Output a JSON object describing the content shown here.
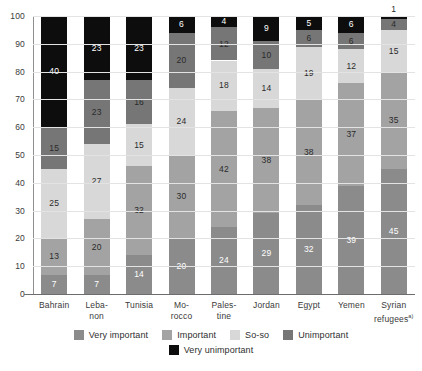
{
  "chart_data": {
    "type": "bar",
    "subtype": "stacked-bar-100-percent",
    "title": "",
    "subtitle": "",
    "xlabel": "",
    "ylabel": "",
    "ylim": [
      0,
      100
    ],
    "yticks": [
      0,
      10,
      20,
      30,
      40,
      50,
      60,
      70,
      80,
      90,
      100
    ],
    "grid": true,
    "grid_axis": "y",
    "legend_position": "bottom",
    "stack_order": "bottom-to-top",
    "categories": [
      "Bahrain",
      "Lebanon",
      "Tunisia",
      "Morocco",
      "Palestine",
      "Jordan",
      "Egypt",
      "Yemen",
      "Syrian refugees"
    ],
    "category_labels_wrapped": [
      [
        "Bahrain"
      ],
      [
        "Leba-",
        "non"
      ],
      [
        "Tunisia"
      ],
      [
        "Mo-",
        "rocco"
      ],
      [
        "Pales-",
        "tine"
      ],
      [
        "Jordan"
      ],
      [
        "Egypt"
      ],
      [
        "Yemen"
      ],
      [
        "Syrian",
        "refugees"
      ]
    ],
    "category_label_superscript": [
      "",
      "",
      "",
      "",
      "",
      "",
      "",
      "",
      "a)"
    ],
    "series": [
      {
        "name": "Very important",
        "color": "#8b8b8b",
        "label_color": "light",
        "values": [
          7,
          7,
          14,
          20,
          24,
          29,
          32,
          39,
          45
        ]
      },
      {
        "name": "Important",
        "color": "#a3a3a3",
        "label_color": "dark",
        "values": [
          13,
          20,
          32,
          30,
          42,
          38,
          38,
          37,
          35
        ]
      },
      {
        "name": "So-so",
        "color": "#d8d8d8",
        "label_color": "dark",
        "values": [
          25,
          27,
          15,
          24,
          18,
          14,
          19,
          12,
          15
        ]
      },
      {
        "name": "Unimportant",
        "color": "#767676",
        "label_color": "dark",
        "values": [
          15,
          23,
          16,
          20,
          12,
          10,
          6,
          6,
          4
        ]
      },
      {
        "name": "Very unimportant",
        "color": "#0d0d0d",
        "label_color": "light",
        "values": [
          40,
          23,
          23,
          6,
          4,
          9,
          5,
          6,
          1
        ]
      }
    ]
  },
  "legend": {
    "items": [
      {
        "label": "Very important",
        "color": "#8b8b8b"
      },
      {
        "label": "Important",
        "color": "#a3a3a3"
      },
      {
        "label": "So-so",
        "color": "#d8d8d8"
      },
      {
        "label": "Unimportant",
        "color": "#767676"
      },
      {
        "label": "Very unimportant",
        "color": "#0d0d0d"
      }
    ]
  },
  "colors": {
    "background": "#ffffff",
    "axis": "#6d6d6d",
    "grid": "#e3e3e3",
    "tick_text": "#3a3a3a"
  }
}
